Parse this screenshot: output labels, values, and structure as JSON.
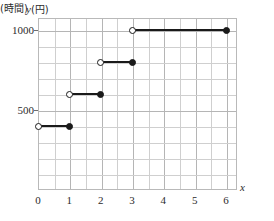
{
  "chart_data": {
    "type": "line",
    "subtype": "step",
    "title": "",
    "xlabel": "x (時間)",
    "ylabel": "y (円)",
    "xlabel_variable": "x",
    "xlabel_unit": "(時間)",
    "ylabel_variable": "y",
    "ylabel_unit": "(円)",
    "xlim": [
      0,
      6.35
    ],
    "ylim": [
      0,
      1075
    ],
    "grid": true,
    "grid_x_step": 0.5,
    "grid_y_step": 100,
    "legend": "none",
    "xticks": [
      0,
      1,
      2,
      3,
      4,
      5,
      6
    ],
    "xtick_labels": [
      "0",
      "1",
      "2",
      "3",
      "4",
      "5",
      "6"
    ],
    "yticks": [
      500,
      1000
    ],
    "ytick_labels": [
      "500",
      "1000"
    ],
    "line_color": "#1a1a1a",
    "grid_color": "#cfcfcf",
    "border_color": "#b9b9b9",
    "steps": [
      {
        "x_start": 0,
        "x_end": 1,
        "y": 400,
        "start_marker": "open",
        "end_marker": "closed"
      },
      {
        "x_start": 1,
        "x_end": 2,
        "y": 600,
        "start_marker": "open",
        "end_marker": "closed"
      },
      {
        "x_start": 2,
        "x_end": 3,
        "y": 800,
        "start_marker": "open",
        "end_marker": "closed"
      },
      {
        "x_start": 3,
        "x_end": 6,
        "y": 1000,
        "start_marker": "open",
        "end_marker": "closed"
      }
    ]
  }
}
